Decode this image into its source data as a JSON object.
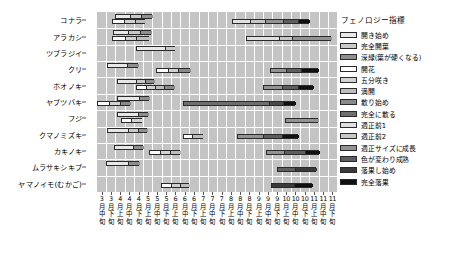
{
  "chart_data": {
    "type": "bar",
    "title": "",
    "xlabel": "",
    "ylabel": "",
    "grid": true,
    "legend_position": "right",
    "plot_background": "#c4c4c4",
    "gridline_color": "#ffffff",
    "x_categories": [
      {
        "month": "3月",
        "third": "中旬"
      },
      {
        "month": "3月",
        "third": "下旬"
      },
      {
        "month": "4月",
        "third": "上旬"
      },
      {
        "month": "4月",
        "third": "中旬"
      },
      {
        "month": "4月",
        "third": "下旬"
      },
      {
        "month": "5月",
        "third": "上旬"
      },
      {
        "month": "5月",
        "third": "中旬"
      },
      {
        "month": "5月",
        "third": "下旬"
      },
      {
        "month": "6月",
        "third": "上旬"
      },
      {
        "month": "6月",
        "third": "中旬"
      },
      {
        "month": "6月",
        "third": "下旬"
      },
      {
        "month": "7月",
        "third": "上旬"
      },
      {
        "month": "7月",
        "third": "中旬"
      },
      {
        "month": "7月",
        "third": "下旬"
      },
      {
        "month": "8月",
        "third": "上旬"
      },
      {
        "month": "8月",
        "third": "中旬"
      },
      {
        "month": "8月",
        "third": "下旬"
      },
      {
        "month": "9月",
        "third": "上旬"
      },
      {
        "month": "9月",
        "third": "中旬"
      },
      {
        "month": "9月",
        "third": "下旬"
      },
      {
        "month": "10月",
        "third": "上旬"
      },
      {
        "month": "10月",
        "third": "中旬"
      },
      {
        "month": "10月",
        "third": "下旬"
      },
      {
        "month": "11月",
        "third": "上旬"
      },
      {
        "month": "11月",
        "third": "中旬"
      },
      {
        "month": "11月",
        "third": "下旬"
      }
    ],
    "species": [
      "コナラ",
      "アラカシ",
      "ツブラジイ",
      "クリ",
      "ホオノキ",
      "ヤブツバキ",
      "フジ",
      "クマノミズキ",
      "カキノキ",
      "ムラサキシキブ",
      "ヤマノイモ(むかご)"
    ],
    "legend": {
      "title": "フェノロジー指標",
      "entries": [
        {
          "label": "開き始め",
          "color": "#e8e8e8"
        },
        {
          "label": "完全開葉",
          "color": "#c9c9c9"
        },
        {
          "label": "深緑(葉が硬くなる)",
          "color": "#8f8f8f"
        },
        {
          "label": "開花",
          "color": "#ffffff"
        },
        {
          "label": "五分咲き",
          "color": "#d2d2d2"
        },
        {
          "label": "満開",
          "color": "#bdbdbd"
        },
        {
          "label": "散り始め",
          "color": "#8a8a8a"
        },
        {
          "label": "完全に散る",
          "color": "#6e6e6e"
        },
        {
          "label": "適正前1",
          "color": "#e0e0e0"
        },
        {
          "label": "適正前2",
          "color": "#c6c6c6"
        },
        {
          "label": "適正サイズに成長",
          "color": "#939393"
        },
        {
          "label": "色が変わり成熟",
          "color": "#5e5e5e"
        },
        {
          "label": "落果し始め",
          "color": "#3a3a3a"
        },
        {
          "label": "完全落果",
          "color": "#111111"
        }
      ]
    },
    "rows": [
      {
        "species": "コナラ",
        "bars": [
          {
            "track": "leaf",
            "start": 2.0,
            "segments": [
              {
                "stage": "開き始め",
                "span": 1.6,
                "color": "#e8e8e8"
              },
              {
                "stage": "完全開葉",
                "span": 1.2,
                "color": "#c9c9c9"
              },
              {
                "stage": "深緑(葉が硬くなる)",
                "span": 1.2,
                "color": "#8f8f8f"
              }
            ]
          },
          {
            "track": "fruit",
            "start": 1.6,
            "segments": [
              {
                "stage": "開花",
                "span": 1.3,
                "color": "#ffffff"
              },
              {
                "stage": "五分咲き",
                "span": 1.2,
                "color": "#d2d2d2"
              },
              {
                "stage": "満開",
                "span": 1.1,
                "color": "#bdbdbd"
              }
            ]
          },
          {
            "track": "fruit2",
            "start": 14.6,
            "segments": [
              {
                "stage": "適正前1",
                "span": 2.0,
                "color": "#e0e0e0"
              },
              {
                "stage": "適正前2",
                "span": 1.6,
                "color": "#c6c6c6"
              },
              {
                "stage": "適正サイズに成長",
                "span": 2.0,
                "color": "#939393"
              },
              {
                "stage": "色が変わり成熟",
                "span": 1.6,
                "color": "#5e5e5e"
              },
              {
                "stage": "完全落果",
                "span": 1.2,
                "color": "#111111"
              }
            ]
          }
        ]
      },
      {
        "species": "アラカシ",
        "bars": [
          {
            "track": "leaf",
            "start": 1.7,
            "segments": [
              {
                "stage": "開き始め",
                "span": 1.7,
                "color": "#e8e8e8"
              },
              {
                "stage": "完全開葉",
                "span": 1.3,
                "color": "#c9c9c9"
              },
              {
                "stage": "深緑(葉が硬くなる)",
                "span": 1.2,
                "color": "#8f8f8f"
              }
            ]
          },
          {
            "track": "fruit",
            "start": 1.6,
            "segments": [
              {
                "stage": "開花",
                "span": 1.4,
                "color": "#ffffff"
              },
              {
                "stage": "五分咲き",
                "span": 1.2,
                "color": "#d2d2d2"
              },
              {
                "stage": "満開",
                "span": 1.4,
                "color": "#bdbdbd"
              }
            ]
          },
          {
            "track": "fruit2",
            "start": 16.1,
            "segments": [
              {
                "stage": "適正前1",
                "span": 3.6,
                "color": "#e0e0e0"
              },
              {
                "stage": "適正前2",
                "span": 1.4,
                "color": "#c6c6c6"
              },
              {
                "stage": "適正サイズに成長",
                "span": 4.3,
                "color": "#939393"
              }
            ]
          }
        ]
      },
      {
        "species": "ツブラジイ",
        "bars": [
          {
            "track": "leaf",
            "start": 4.2,
            "segments": [
              {
                "stage": "開き始め",
                "span": 3.2,
                "color": "#e8e8e8"
              },
              {
                "stage": "完全開葉",
                "span": 1.1,
                "color": "#c9c9c9"
              }
            ]
          }
        ]
      },
      {
        "species": "クリ",
        "bars": [
          {
            "track": "leaf",
            "start": 1.1,
            "segments": [
              {
                "stage": "開き始め",
                "span": 2.2,
                "color": "#e8e8e8"
              },
              {
                "stage": "深緑(葉が硬くなる)",
                "span": 1.1,
                "color": "#8f8f8f"
              }
            ]
          },
          {
            "track": "fruit",
            "start": 6.4,
            "segments": [
              {
                "stage": "開花",
                "span": 1.3,
                "color": "#ffffff"
              },
              {
                "stage": "五分咲き",
                "span": 1.1,
                "color": "#d2d2d2"
              },
              {
                "stage": "満開",
                "span": 1.3,
                "color": "#8a8a8a"
              }
            ]
          },
          {
            "track": "fruit2",
            "start": 18.7,
            "segments": [
              {
                "stage": "適正サイズに成長",
                "span": 1.8,
                "color": "#939393"
              },
              {
                "stage": "色が変わり成熟",
                "span": 1.6,
                "color": "#5e5e5e"
              },
              {
                "stage": "完全落果",
                "span": 1.8,
                "color": "#111111"
              }
            ]
          }
        ]
      },
      {
        "species": "ホオノキ",
        "bars": [
          {
            "track": "leaf",
            "start": 2.2,
            "segments": [
              {
                "stage": "開き始め",
                "span": 2.0,
                "color": "#e8e8e8"
              },
              {
                "stage": "完全開葉",
                "span": 1.0,
                "color": "#c9c9c9"
              },
              {
                "stage": "深緑(葉が硬くなる)",
                "span": 1.0,
                "color": "#8f8f8f"
              }
            ]
          },
          {
            "track": "fruit",
            "start": 4.2,
            "segments": [
              {
                "stage": "開花",
                "span": 1.1,
                "color": "#ffffff"
              },
              {
                "stage": "五分咲き",
                "span": 1.0,
                "color": "#d2d2d2"
              },
              {
                "stage": "満開",
                "span": 1.0,
                "color": "#bdbdbd"
              },
              {
                "stage": "散り始め",
                "span": 1.0,
                "color": "#8a8a8a"
              }
            ]
          },
          {
            "track": "fruit2",
            "start": 18.0,
            "segments": [
              {
                "stage": "適正サイズに成長",
                "span": 2.0,
                "color": "#939393"
              },
              {
                "stage": "色が変わり成熟",
                "span": 1.8,
                "color": "#5e5e5e"
              },
              {
                "stage": "完全落果",
                "span": 1.6,
                "color": "#111111"
              }
            ]
          }
        ]
      },
      {
        "species": "ヤブツバキ",
        "bars": [
          {
            "track": "leaf",
            "start": 2.2,
            "segments": [
              {
                "stage": "開き始め",
                "span": 2.3,
                "color": "#e8e8e8"
              },
              {
                "stage": "深緑(葉が硬くなる)",
                "span": 1.1,
                "color": "#8f8f8f"
              }
            ]
          },
          {
            "track": "fruit",
            "start": 0.0,
            "segments": [
              {
                "stage": "開花",
                "span": 1.3,
                "color": "#ffffff"
              },
              {
                "stage": "五分咲き",
                "span": 1.2,
                "color": "#d2d2d2"
              },
              {
                "stage": "散り始め",
                "span": 1.1,
                "color": "#8a8a8a"
              }
            ]
          },
          {
            "track": "fruit2",
            "start": 9.3,
            "segments": [
              {
                "stage": "適正サイズに成長",
                "span": 9.3,
                "color": "#6e6e6e"
              },
              {
                "stage": "色が変わり成熟",
                "span": 1.5,
                "color": "#4a4a4a"
              },
              {
                "stage": "完全落果",
                "span": 1.4,
                "color": "#111111"
              }
            ]
          }
        ]
      },
      {
        "species": "フジ",
        "bars": [
          {
            "track": "leaf",
            "start": 2.2,
            "segments": [
              {
                "stage": "開き始め",
                "span": 2.2,
                "color": "#e8e8e8"
              },
              {
                "stage": "深緑(葉が硬くなる)",
                "span": 1.1,
                "color": "#8f8f8f"
              }
            ]
          },
          {
            "track": "fruit",
            "start": 2.6,
            "segments": [
              {
                "stage": "開花",
                "span": 1.1,
                "color": "#ffffff"
              },
              {
                "stage": "五分咲き",
                "span": 1.2,
                "color": "#d2d2d2"
              }
            ]
          },
          {
            "track": "fruit2",
            "start": 20.4,
            "segments": [
              {
                "stage": "適正サイズに成長",
                "span": 3.5,
                "color": "#939393"
              }
            ]
          }
        ]
      },
      {
        "species": "クマノミズキ",
        "bars": [
          {
            "track": "leaf",
            "start": 1.1,
            "segments": [
              {
                "stage": "開き始め",
                "span": 2.3,
                "color": "#e8e8e8"
              },
              {
                "stage": "完全開葉",
                "span": 1.0,
                "color": "#c9c9c9"
              },
              {
                "stage": "深緑(葉が硬くなる)",
                "span": 1.0,
                "color": "#8f8f8f"
              }
            ]
          },
          {
            "track": "fruit",
            "start": 9.3,
            "segments": [
              {
                "stage": "開花",
                "span": 1.0,
                "color": "#ffffff"
              },
              {
                "stage": "満開",
                "span": 1.2,
                "color": "#bdbdbd"
              }
            ]
          },
          {
            "track": "fruit2",
            "start": 15.2,
            "segments": [
              {
                "stage": "適正サイズに成長",
                "span": 2.8,
                "color": "#939393"
              },
              {
                "stage": "色が変わり成熟",
                "span": 2.0,
                "color": "#5e5e5e"
              },
              {
                "stage": "完全落果",
                "span": 1.8,
                "color": "#111111"
              }
            ]
          }
        ]
      },
      {
        "species": "カキノキ",
        "bars": [
          {
            "track": "leaf",
            "start": 1.8,
            "segments": [
              {
                "stage": "開き始め",
                "span": 2.1,
                "color": "#e8e8e8"
              },
              {
                "stage": "深緑(葉が硬くなる)",
                "span": 1.1,
                "color": "#8f8f8f"
              }
            ]
          },
          {
            "track": "fruit",
            "start": 5.6,
            "segments": [
              {
                "stage": "開花",
                "span": 1.2,
                "color": "#ffffff"
              },
              {
                "stage": "五分咲き",
                "span": 1.1,
                "color": "#d2d2d2"
              },
              {
                "stage": "満開",
                "span": 1.1,
                "color": "#bdbdbd"
              }
            ]
          },
          {
            "track": "fruit2",
            "start": 18.3,
            "segments": [
              {
                "stage": "適正サイズに成長",
                "span": 2.0,
                "color": "#939393"
              },
              {
                "stage": "色が変わり成熟",
                "span": 2.2,
                "color": "#5e5e5e"
              },
              {
                "stage": "完全落果",
                "span": 1.6,
                "color": "#111111"
              }
            ]
          }
        ]
      },
      {
        "species": "ムラサキシキブ",
        "bars": [
          {
            "track": "leaf",
            "start": 1.0,
            "segments": [
              {
                "stage": "開き始め",
                "span": 2.4,
                "color": "#e8e8e8"
              },
              {
                "stage": "深緑(葉が硬くなる)",
                "span": 1.1,
                "color": "#8f8f8f"
              }
            ]
          },
          {
            "track": "fruit2",
            "start": 19.5,
            "segments": [
              {
                "stage": "色が変わり成熟",
                "span": 2.0,
                "color": "#5e5e5e"
              },
              {
                "stage": "落果し始め",
                "span": 2.2,
                "color": "#3a3a3a"
              }
            ]
          }
        ]
      },
      {
        "species": "ヤマノイモ(むかご)",
        "bars": [
          {
            "track": "fruit",
            "start": 6.9,
            "segments": [
              {
                "stage": "開花",
                "span": 1.1,
                "color": "#ffffff"
              },
              {
                "stage": "五分咲き",
                "span": 1.0,
                "color": "#d2d2d2"
              },
              {
                "stage": "満開",
                "span": 1.0,
                "color": "#bdbdbd"
              }
            ]
          },
          {
            "track": "fruit2",
            "start": 18.8,
            "segments": [
              {
                "stage": "落果し始め",
                "span": 2.5,
                "color": "#3a3a3a"
              },
              {
                "stage": "完全落果",
                "span": 2.0,
                "color": "#111111"
              }
            ]
          }
        ]
      }
    ]
  }
}
